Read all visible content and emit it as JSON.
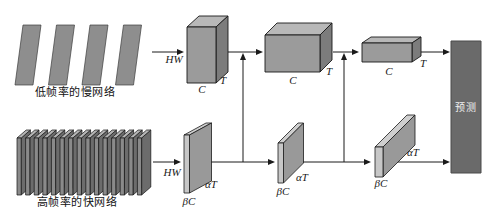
{
  "diagram": {
    "slow_pathway": {
      "label": "低帧率的慢网络",
      "input_label": "HW",
      "frame_count": 4,
      "stages": [
        {
          "width_label": "C",
          "depth_label": "T"
        },
        {
          "width_label": "C",
          "depth_label": "T"
        },
        {
          "width_label": "C",
          "depth_label": "T"
        }
      ]
    },
    "fast_pathway": {
      "label": "高帧率的快网络",
      "input_label": "HW",
      "frame_count": 15,
      "stages": [
        {
          "width_label": "βC",
          "depth_label": "αT"
        },
        {
          "width_label": "βC",
          "depth_label": "αT"
        },
        {
          "width_label": "βC",
          "depth_label": "αT"
        }
      ]
    },
    "prediction": {
      "label": "预测"
    },
    "colors": {
      "line": "#1a1a1a",
      "cuboid_front": "#9b9b9b",
      "cuboid_top": "#b8b8b8",
      "cuboid_side": "#7c7c7c",
      "slab_front": "#c7c7c7",
      "slab_side": "#999999",
      "slab_top": "#cfcfcf",
      "frame_fill": "#8e8e8e",
      "frame_edge": "#3c3c3c",
      "fast_frame_front": "#8a8a8a",
      "fast_frame_side": "#6c6c6c",
      "fast_frame_top": "#b4b4b4",
      "prediction_fill": "#6a6a6a",
      "prediction_edge": "#4a4a4a"
    }
  }
}
